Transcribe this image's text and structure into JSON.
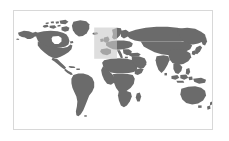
{
  "widget": {
    "name": "world-map",
    "title": "World map",
    "type": "map",
    "projection": "equirectangular",
    "background_color": "#ffffff",
    "frame": {
      "x": 13,
      "y": 10,
      "width": 200,
      "height": 120,
      "border_color": "#d8d8d8",
      "border_width": 1,
      "fill_color": "#ffffff"
    },
    "ocean_color": "#ffffff",
    "land_color": "#6b6b6b",
    "land_stroke_color": "#6b6b6b"
  },
  "highlight": {
    "label": "Europe",
    "color": "#c9c9c9",
    "opacity": 0.62,
    "x_pct": 40.5,
    "y_pct": 14.0,
    "width_pct": 11.5,
    "height_pct": 26.5
  },
  "legend": {
    "visible": false,
    "entries": []
  },
  "labels": {
    "visible": false,
    "items": []
  },
  "chart_data": {
    "type": "map",
    "title": "",
    "projection": "equirectangular",
    "lon_range": [
      -180,
      180
    ],
    "lat_range": [
      -90,
      90
    ],
    "grid": false,
    "legend_position": "none",
    "regions": [
      {
        "name": "North America",
        "state": "normal",
        "fill": "#6b6b6b"
      },
      {
        "name": "Greenland",
        "state": "normal",
        "fill": "#6b6b6b"
      },
      {
        "name": "South America",
        "state": "normal",
        "fill": "#6b6b6b"
      },
      {
        "name": "Africa",
        "state": "normal",
        "fill": "#6b6b6b"
      },
      {
        "name": "Europe",
        "state": "highlighted",
        "fill": "#6b6b6b",
        "overlay": "#c9c9c9"
      },
      {
        "name": "Asia",
        "state": "normal",
        "fill": "#6b6b6b"
      },
      {
        "name": "Australia",
        "state": "normal",
        "fill": "#6b6b6b"
      },
      {
        "name": "New Zealand",
        "state": "normal",
        "fill": "#6b6b6b"
      },
      {
        "name": "Japan",
        "state": "normal",
        "fill": "#6b6b6b"
      },
      {
        "name": "Indonesia",
        "state": "normal",
        "fill": "#6b6b6b"
      },
      {
        "name": "Madagascar",
        "state": "normal",
        "fill": "#6b6b6b"
      },
      {
        "name": "British Isles",
        "state": "highlighted",
        "fill": "#6b6b6b"
      },
      {
        "name": "Iceland",
        "state": "normal",
        "fill": "#6b6b6b"
      },
      {
        "name": "Antarctica",
        "state": "absent",
        "fill": "none"
      }
    ]
  }
}
